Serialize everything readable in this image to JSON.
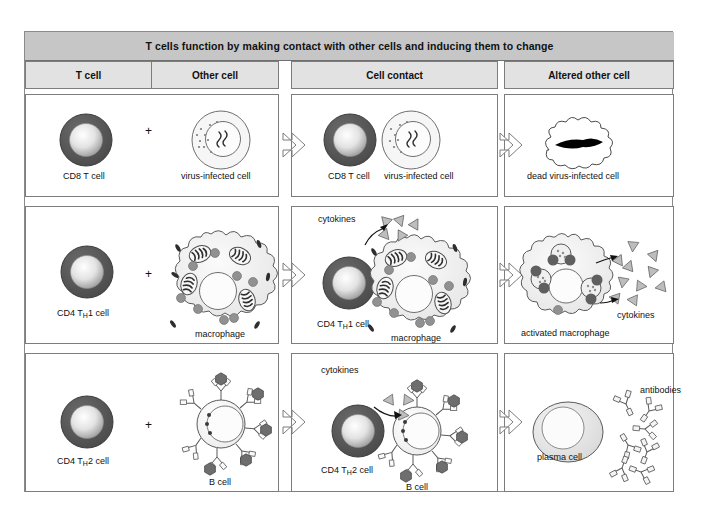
{
  "figure": {
    "title": "T cells function by making contact with other cells and inducing them to change",
    "columns": [
      {
        "label": "T cell"
      },
      {
        "label": "Other cell"
      },
      {
        "label": "Cell contact"
      },
      {
        "label": "Altered other cell"
      }
    ]
  },
  "colors": {
    "title_bar": "#c6c6c6",
    "column_header": "#e2e2e2",
    "frame_border": "#8a8a8a",
    "tcell_membrane": "#555555",
    "tcell_nucleus_light": "#ffffff",
    "tcell_nucleus_dark": "#9a9a9a",
    "cell_fill": "#f2f2f2",
    "organelle_gray": "#8f8f8f",
    "cytokine_fill": "#b5b5b5",
    "antigen_fill": "#6e6e6e",
    "dead_cell_fill": "#000000"
  },
  "rows": [
    {
      "id": "cd8-row",
      "t_cell": {
        "label": "CD8 T cell"
      },
      "other_cell": {
        "label": "virus-infected cell"
      },
      "plus": "+",
      "contact": {
        "t_cell_label": "CD8 T cell",
        "other_cell_label": "virus-infected cell"
      },
      "altered": {
        "label": "dead virus-infected cell"
      }
    },
    {
      "id": "th1-row",
      "t_cell": {
        "label_prefix": "CD4 T",
        "label_sub": "H",
        "label_suffix": "1 cell"
      },
      "other_cell": {
        "label": "macrophage"
      },
      "plus": "+",
      "contact": {
        "t_cell_prefix": "CD4 T",
        "t_cell_sub": "H",
        "t_cell_suffix": "1 cell",
        "other_cell_label": "macrophage",
        "cytokines_label": "cytokines"
      },
      "altered": {
        "label": "activated macrophage",
        "cytokines_label": "cytokines"
      }
    },
    {
      "id": "th2-row",
      "t_cell": {
        "label_prefix": "CD4 T",
        "label_sub": "H",
        "label_suffix": "2 cell"
      },
      "other_cell": {
        "label": "B cell"
      },
      "plus": "+",
      "contact": {
        "t_cell_prefix": "CD4 T",
        "t_cell_sub": "H",
        "t_cell_suffix": "2 cell",
        "other_cell_label": "B cell",
        "cytokines_label": "cytokines"
      },
      "altered": {
        "label": "plasma cell",
        "antibodies_label": "antibodies"
      }
    }
  ]
}
